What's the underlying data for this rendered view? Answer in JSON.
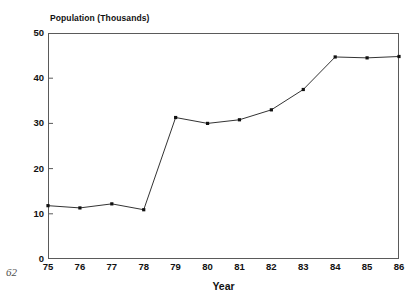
{
  "page": {
    "number": "62"
  },
  "chart_data": {
    "type": "line",
    "title": "Population (Thousands)",
    "xlabel": "Year",
    "ylabel": "Population (Thousands)",
    "categories": [
      "75",
      "76",
      "77",
      "78",
      "79",
      "80",
      "81",
      "82",
      "83",
      "84",
      "85",
      "86"
    ],
    "x": [
      75,
      76,
      77,
      78,
      79,
      80,
      81,
      82,
      83,
      84,
      85,
      86
    ],
    "values": [
      11.8,
      11.3,
      12.2,
      10.9,
      31.3,
      30.0,
      30.8,
      33.0,
      37.5,
      44.7,
      44.5,
      44.8
    ],
    "series": [
      {
        "name": "Population",
        "values": [
          11.8,
          11.3,
          12.2,
          10.9,
          31.3,
          30.0,
          30.8,
          33.0,
          37.5,
          44.7,
          44.5,
          44.8
        ]
      }
    ],
    "xlim": [
      75,
      86
    ],
    "ylim": [
      0,
      50
    ],
    "yticks": [
      0,
      10,
      20,
      30,
      40,
      50
    ],
    "ytick_labels": [
      "0",
      "10",
      "20",
      "30",
      "40",
      "50"
    ],
    "xticks": [
      75,
      76,
      77,
      78,
      79,
      80,
      81,
      82,
      83,
      84,
      85,
      86
    ],
    "xtick_labels": [
      "75",
      "76",
      "77",
      "78",
      "79",
      "80",
      "81",
      "82",
      "83",
      "84",
      "85",
      "86"
    ],
    "grid": false,
    "legend": false,
    "legend_position": "none",
    "marker": "square",
    "line_color": "#333333",
    "marker_color": "#111111",
    "frame_color": "#5a5a5a",
    "background": "#ffffff"
  }
}
